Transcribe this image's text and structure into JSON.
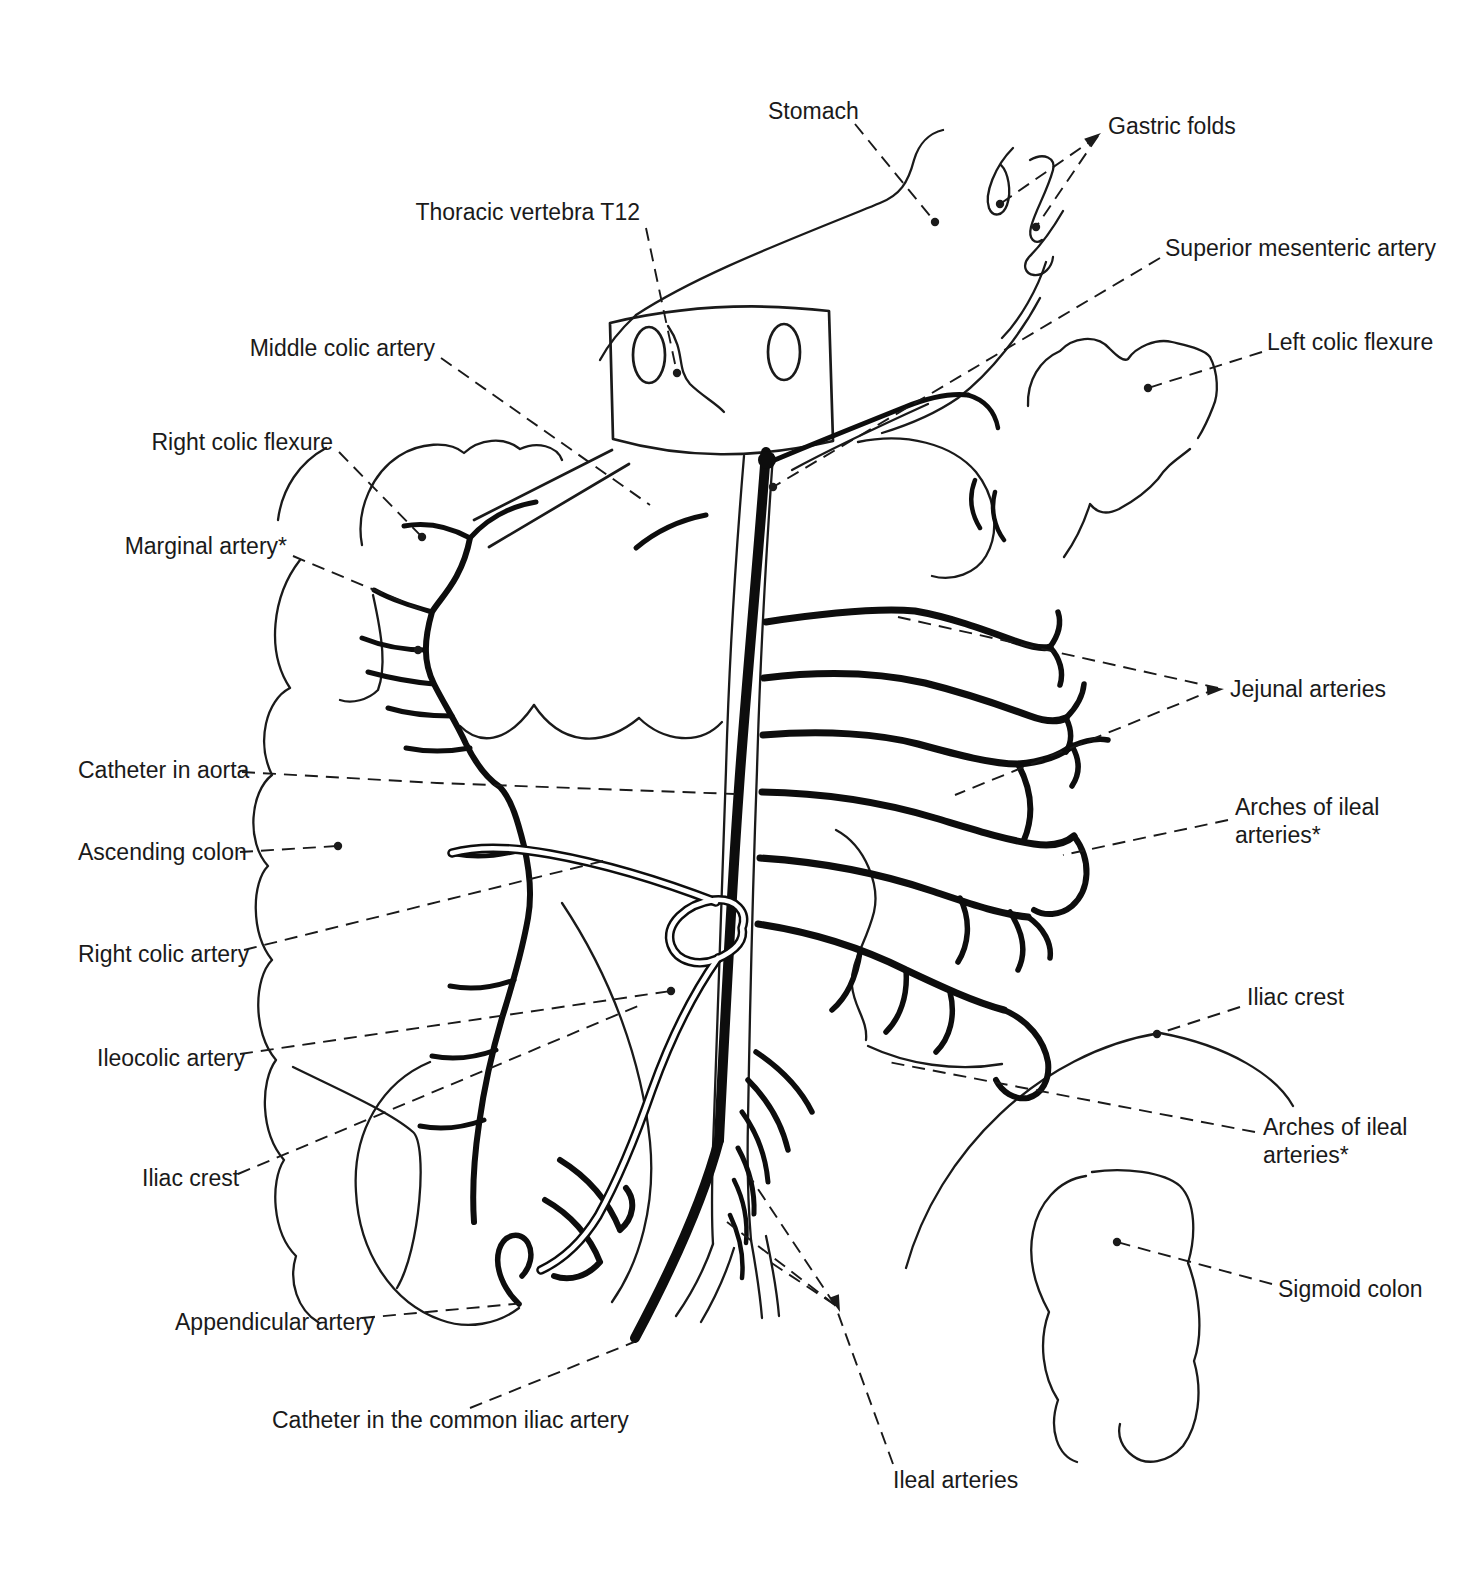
{
  "canvas": {
    "width": 1482,
    "height": 1581,
    "background": "#ffffff",
    "ink": "#1a1a1a"
  },
  "figure": {
    "kind": "anatomical line illustration"
  },
  "labels": [
    {
      "id": "stomach",
      "text": "Stomach",
      "x": 768,
      "y": 119,
      "anchor": "start",
      "leaders": [
        [
          [
            855,
            124
          ],
          [
            935,
            222
          ]
        ]
      ],
      "dots": [
        [
          935,
          222
        ]
      ]
    },
    {
      "id": "gastric-folds",
      "text": "Gastric folds",
      "x": 1108,
      "y": 134,
      "anchor": "start",
      "leaders": [
        [
          [
            1098,
            136
          ],
          [
            1000,
            204
          ]
        ],
        [
          [
            1098,
            136
          ],
          [
            1036,
            227
          ]
        ]
      ],
      "dots": [
        [
          1000,
          204
        ],
        [
          1036,
          227
        ]
      ],
      "arrow": {
        "x": 1101,
        "y": 133,
        "angle": -35
      }
    },
    {
      "id": "thoracic-vertebra-t12",
      "text": "Thoracic vertebra T12",
      "x": 640,
      "y": 220,
      "anchor": "end",
      "leaders": [
        [
          [
            646,
            228
          ],
          [
            677,
            373
          ]
        ]
      ],
      "dots": [
        [
          677,
          373
        ]
      ]
    },
    {
      "id": "superior-mesenteric-artery",
      "text": "Superior mesenteric artery",
      "x": 1165,
      "y": 256,
      "anchor": "start",
      "leaders": [
        [
          [
            1160,
            258
          ],
          [
            773,
            487
          ]
        ]
      ],
      "dots": [
        [
          773,
          487
        ]
      ]
    },
    {
      "id": "left-colic-flexure",
      "text": "Left colic flexure",
      "x": 1267,
      "y": 350,
      "anchor": "start",
      "leaders": [
        [
          [
            1262,
            352
          ],
          [
            1148,
            388
          ]
        ]
      ],
      "dots": [
        [
          1148,
          388
        ]
      ]
    },
    {
      "id": "middle-colic-artery",
      "text": "Middle colic artery",
      "x": 435,
      "y": 356,
      "anchor": "end",
      "leaders": [
        [
          [
            441,
            358
          ],
          [
            650,
            505
          ]
        ]
      ],
      "dots": []
    },
    {
      "id": "right-colic-flexure",
      "text": "Right colic flexure",
      "x": 333,
      "y": 450,
      "anchor": "end",
      "leaders": [
        [
          [
            339,
            452
          ],
          [
            422,
            537
          ]
        ]
      ],
      "dots": [
        [
          422,
          537
        ]
      ]
    },
    {
      "id": "marginal-artery",
      "text": "Marginal artery*",
      "x": 287,
      "y": 554,
      "anchor": "end",
      "leaders": [
        [
          [
            293,
            556
          ],
          [
            427,
            612
          ]
        ]
      ],
      "dots": [
        [
          418,
          650
        ]
      ]
    },
    {
      "id": "catheter-in-aorta",
      "text": "Catheter in aorta",
      "x": 78,
      "y": 778,
      "anchor": "start",
      "leaders": [
        [
          [
            242,
            772
          ],
          [
            437,
            783
          ],
          [
            735,
            794
          ]
        ]
      ],
      "dots": []
    },
    {
      "id": "ascending-colon",
      "text": "Ascending colon",
      "x": 78,
      "y": 860,
      "anchor": "start",
      "leaders": [
        [
          [
            240,
            852
          ],
          [
            338,
            846
          ]
        ]
      ],
      "dots": [
        [
          338,
          846
        ]
      ]
    },
    {
      "id": "right-colic-artery",
      "text": "Right colic artery",
      "x": 78,
      "y": 962,
      "anchor": "start",
      "leaders": [
        [
          [
            244,
            950
          ],
          [
            607,
            860
          ]
        ]
      ],
      "dots": []
    },
    {
      "id": "ileocolic-artery",
      "text": "Ileocolic artery",
      "x": 97,
      "y": 1066,
      "anchor": "start",
      "leaders": [
        [
          [
            240,
            1054
          ],
          [
            671,
            991
          ]
        ]
      ],
      "dots": [
        [
          671,
          991
        ]
      ]
    },
    {
      "id": "iliac-crest-left",
      "text": "Iliac crest",
      "x": 142,
      "y": 1186,
      "anchor": "start",
      "leaders": [
        [
          [
            238,
            1174
          ],
          [
            638,
            1006
          ]
        ]
      ],
      "dots": []
    },
    {
      "id": "appendicular-artery",
      "text": "Appendicular artery",
      "x": 175,
      "y": 1330,
      "anchor": "start",
      "leaders": [
        [
          [
            362,
            1318
          ],
          [
            525,
            1303
          ]
        ]
      ],
      "dots": []
    },
    {
      "id": "catheter-in-common-iliac",
      "text": "Catheter in the common iliac artery",
      "x": 272,
      "y": 1428,
      "anchor": "start",
      "leaders": [
        [
          [
            470,
            1408
          ],
          [
            634,
            1342
          ]
        ]
      ],
      "dots": []
    },
    {
      "id": "ileal-arteries",
      "text": "Ileal arteries",
      "x": 893,
      "y": 1488,
      "anchor": "start",
      "leaders": [
        [
          [
            893,
            1464
          ],
          [
            835,
            1305
          ]
        ],
        [
          [
            835,
            1305
          ],
          [
            750,
            1177
          ]
        ],
        [
          [
            835,
            1305
          ],
          [
            727,
            1222
          ]
        ],
        [
          [
            835,
            1305
          ],
          [
            767,
            1260
          ]
        ]
      ],
      "dots": [],
      "arrow": {
        "x": 840,
        "y": 1312,
        "angle": 70
      }
    },
    {
      "id": "jejunal-arteries",
      "text": "Jejunal arteries",
      "x": 1230,
      "y": 697,
      "anchor": "start",
      "leaders": [
        [
          [
            1218,
            688
          ],
          [
            898,
            617
          ]
        ],
        [
          [
            1218,
            688
          ],
          [
            955,
            795
          ]
        ]
      ],
      "dots": [],
      "arrow": {
        "x": 1224,
        "y": 689,
        "angle": -5
      }
    },
    {
      "id": "arches-of-ileal-arteries-upper",
      "text": "Arches of ileal\narteries*",
      "x": 1235,
      "y": 815,
      "anchor": "start",
      "leaders": [
        [
          [
            1228,
            820
          ],
          [
            1063,
            855
          ]
        ]
      ],
      "dots": []
    },
    {
      "id": "iliac-crest-right",
      "text": "Iliac crest",
      "x": 1247,
      "y": 1005,
      "anchor": "start",
      "leaders": [
        [
          [
            1240,
            1007
          ],
          [
            1157,
            1034
          ]
        ]
      ],
      "dots": [
        [
          1157,
          1034
        ]
      ]
    },
    {
      "id": "arches-of-ileal-arteries-lower",
      "text": "Arches of ileal\narteries*",
      "x": 1263,
      "y": 1135,
      "anchor": "start",
      "leaders": [
        [
          [
            1255,
            1132
          ],
          [
            888,
            1062
          ]
        ]
      ],
      "dots": []
    },
    {
      "id": "sigmoid-colon",
      "text": "Sigmoid colon",
      "x": 1278,
      "y": 1297,
      "anchor": "start",
      "leaders": [
        [
          [
            1272,
            1284
          ],
          [
            1117,
            1242
          ]
        ]
      ],
      "dots": [
        [
          1117,
          1242
        ]
      ]
    }
  ],
  "style_tokens": {
    "line_height_px": 28,
    "dot_radius": 4.2
  }
}
